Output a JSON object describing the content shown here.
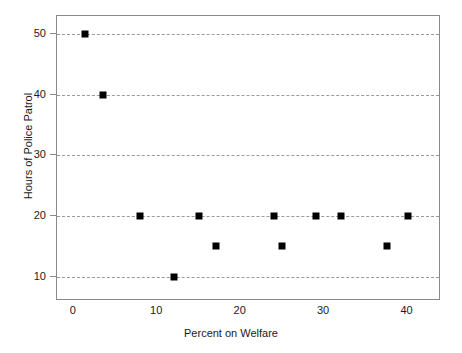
{
  "chart_data": {
    "type": "scatter",
    "title": "",
    "xlabel": "Percent on Welfare",
    "ylabel": "Hours of Police Patrol",
    "xlim": [
      -2,
      44
    ],
    "ylim": [
      6,
      53
    ],
    "xticks": [
      0,
      10,
      20,
      30,
      40
    ],
    "xtick_labels": [
      "0",
      "10",
      "20",
      "30",
      "40"
    ],
    "yticks": [
      10,
      20,
      30,
      40,
      50
    ],
    "ytick_labels": [
      "10",
      "20",
      "30",
      "40",
      "50"
    ],
    "grid": "horizontal-dashed",
    "legend": "none",
    "marker": "filled-square",
    "marker_color": "#000000",
    "grid_color": "#9a9a9a",
    "frame_color": "#8a8a8a",
    "points": [
      {
        "x": 1.3,
        "y": 50
      },
      {
        "x": 3.5,
        "y": 40
      },
      {
        "x": 8,
        "y": 20
      },
      {
        "x": 12,
        "y": 10
      },
      {
        "x": 15,
        "y": 20
      },
      {
        "x": 17,
        "y": 15
      },
      {
        "x": 24,
        "y": 20
      },
      {
        "x": 25,
        "y": 15
      },
      {
        "x": 29,
        "y": 20
      },
      {
        "x": 32,
        "y": 20
      },
      {
        "x": 37.5,
        "y": 15
      },
      {
        "x": 40,
        "y": 20
      }
    ]
  }
}
